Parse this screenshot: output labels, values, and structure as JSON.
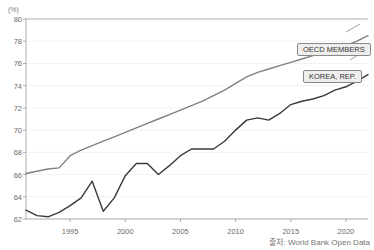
{
  "unit_label": "(%)",
  "source": "출처: World Bank Open Data",
  "legend": {
    "oecd": "OECD MEMBERS",
    "korea": "KOREA, REP."
  },
  "colors": {
    "oecd_line": "#808080",
    "korea_line": "#3a3a3a",
    "axis": "#9a9a9a",
    "grid": "#f0f0f0",
    "text": "#6b6b6b",
    "legend_fill": "#eeeeee",
    "legend_border": "#888888"
  },
  "chart_data": {
    "type": "line",
    "title": "",
    "subtitle": "",
    "xlabel": "",
    "ylabel": "",
    "unit": "(%)",
    "grid": true,
    "legend_position": "inline-right",
    "xlim": [
      1991,
      2022
    ],
    "ylim": [
      62,
      80
    ],
    "ytick_labels": [
      "62",
      "64",
      "66",
      "68",
      "70",
      "72",
      "74",
      "76",
      "78",
      "80"
    ],
    "yticks": [
      62,
      64,
      66,
      68,
      70,
      72,
      74,
      76,
      78,
      80
    ],
    "xtick_labels": [
      "1995",
      "2000",
      "2005",
      "2010",
      "2015",
      "2020"
    ],
    "xticks": [
      1995,
      2000,
      2005,
      2010,
      2015,
      2020
    ],
    "x": [
      1991,
      1992,
      1993,
      1994,
      1995,
      1996,
      1997,
      1998,
      1999,
      2000,
      2001,
      2002,
      2003,
      2004,
      2005,
      2006,
      2007,
      2008,
      2009,
      2010,
      2011,
      2012,
      2013,
      2014,
      2015,
      2016,
      2017,
      2018,
      2019,
      2020,
      2021,
      2022
    ],
    "series": [
      {
        "name": "OECD MEMBERS",
        "color": "#808080",
        "values": [
          66.1,
          66.3,
          66.5,
          66.6,
          67.7,
          68.2,
          68.6,
          69.0,
          69.4,
          69.8,
          70.2,
          70.6,
          71.0,
          71.4,
          71.8,
          72.2,
          72.6,
          73.1,
          73.6,
          74.2,
          74.8,
          75.2,
          75.5,
          75.8,
          76.1,
          76.4,
          76.7,
          77.0,
          77.3,
          77.6,
          78.0,
          78.5
        ]
      },
      {
        "name": "KOREA, REP.",
        "color": "#3a3a3a",
        "values": [
          62.8,
          62.3,
          62.2,
          62.6,
          63.2,
          63.9,
          65.4,
          62.7,
          63.9,
          65.9,
          67.0,
          67.0,
          66.0,
          66.8,
          67.7,
          68.3,
          68.3,
          68.3,
          69.0,
          70.0,
          70.9,
          71.1,
          70.9,
          71.5,
          72.3,
          72.6,
          72.8,
          73.1,
          73.6,
          73.9,
          74.4,
          75.0
        ]
      }
    ],
    "annotations": [
      {
        "label": "OECD MEMBERS",
        "attached_series": "OECD MEMBERS"
      },
      {
        "label": "KOREA, REP.",
        "attached_series": "KOREA, REP."
      }
    ]
  }
}
